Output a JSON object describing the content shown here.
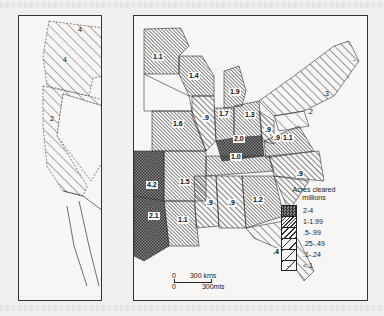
{
  "legend": {
    "title": "Acres cleared",
    "subtitle": "millions",
    "items": [
      {
        "range": "2-4",
        "pattern": "dense-crosshatch"
      },
      {
        "range": "1-1.99",
        "pattern": "dense-diagonal"
      },
      {
        "range": ".5-.99",
        "pattern": "medium-diagonal"
      },
      {
        "range": ".25-.49",
        "pattern": "wide-diagonal"
      },
      {
        "range": ".1-.24",
        "pattern": "sparse-diagonal"
      },
      {
        "range": "<.1",
        "pattern": "dash"
      }
    ]
  },
  "scale_bar": {
    "zero_top": "0",
    "km_label": "300 kms",
    "zero_bottom": "0",
    "mi_label": "300mls"
  },
  "west_panel": {
    "labels": [
      {
        "value": "4",
        "region": "washington"
      },
      {
        "value": "4",
        "region": "oregon"
      },
      {
        "value": "2",
        "region": "california"
      }
    ]
  },
  "east_panel": {
    "labels": [
      {
        "value": "1.1",
        "region": "minnesota"
      },
      {
        "value": "1.4",
        "region": "wisconsin"
      },
      {
        "value": "1.9",
        "region": "michigan"
      },
      {
        "value": ".9",
        "region": "illinois"
      },
      {
        "value": "1.7",
        "region": "indiana"
      },
      {
        "value": "1.3",
        "region": "ohio"
      },
      {
        "value": "1.6",
        "region": "missouri"
      },
      {
        "value": "2.0",
        "region": "kentucky"
      },
      {
        "value": ".9",
        "region": "west-virginia"
      },
      {
        "value": "1.1",
        "region": "virginia"
      },
      {
        "value": "1.0",
        "region": "tennessee"
      },
      {
        "value": "4.2",
        "region": "oklahoma"
      },
      {
        "value": "1.5",
        "region": "arkansas"
      },
      {
        "value": ".9",
        "region": "mississippi"
      },
      {
        "value": ".9",
        "region": "alabama"
      },
      {
        "value": "1.2",
        "region": "georgia"
      },
      {
        "value": ".9",
        "region": "south-carolina"
      },
      {
        "value": ".9",
        "region": "north-carolina"
      },
      {
        "value": "2.1",
        "region": "texas-east"
      },
      {
        "value": "1.1",
        "region": "louisiana"
      },
      {
        "value": ".4",
        "region": "florida"
      },
      {
        "value": ".3",
        "region": "new-york-north"
      },
      {
        "value": ".2",
        "region": "pennsylvania"
      },
      {
        "value": "-",
        "region": "maine"
      },
      {
        "value": "-",
        "region": "vermont"
      }
    ]
  }
}
